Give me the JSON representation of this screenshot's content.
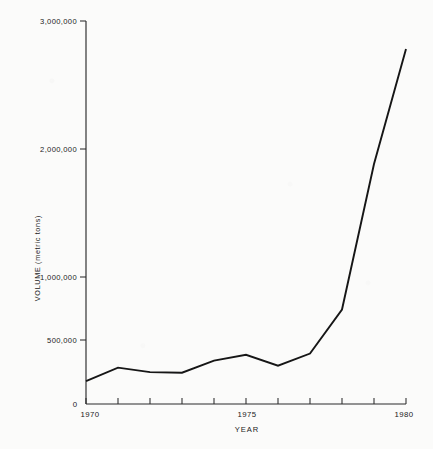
{
  "chart_data": {
    "type": "line",
    "title": "",
    "xlabel": "YEAR",
    "ylabel": "VOLUME (metric tons)",
    "x": [
      1970,
      1971,
      1972,
      1973,
      1974,
      1975,
      1976,
      1977,
      1978,
      1979,
      1980
    ],
    "values": [
      180000,
      285000,
      250000,
      245000,
      340000,
      385000,
      300000,
      395000,
      740000,
      1880000,
      2780000
    ],
    "series": [
      {
        "name": "Volume",
        "values": [
          180000,
          285000,
          250000,
          245000,
          340000,
          385000,
          300000,
          395000,
          740000,
          1880000,
          2780000
        ]
      }
    ],
    "xlim": [
      1970,
      1980
    ],
    "ylim": [
      0,
      3000000
    ],
    "grid": false,
    "legend": false,
    "x_tick_values": [
      1970,
      1971,
      1972,
      1973,
      1974,
      1975,
      1976,
      1977,
      1978,
      1979,
      1980
    ],
    "x_tick_labels_shown": [
      "1970",
      "1975",
      "1980"
    ],
    "x_tick_labeled_values": [
      1970,
      1975,
      1980
    ],
    "y_tick_values": [
      0,
      500000,
      1000000,
      2000000,
      3000000
    ],
    "y_tick_labels": [
      "0",
      "500,000",
      "1,000,000",
      "2,000,000",
      "3,000,000"
    ],
    "line_color": "#161616",
    "axis_color": "#2b2b2b",
    "background_color": "#fbfbfa"
  },
  "axis": {
    "y_title": "VOLUME (metric tons)",
    "x_title": "YEAR",
    "y_labels": {
      "top": "3,000,000",
      "two_million": "2,000,000",
      "one_million": "1,000,000",
      "half_million": "500,000",
      "zero": "0"
    },
    "x_labels": {
      "start": "1970",
      "middle": "1975",
      "end": "1980"
    }
  }
}
